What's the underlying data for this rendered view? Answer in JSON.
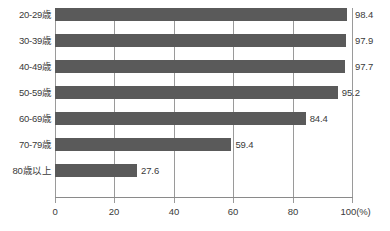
{
  "chart_data": {
    "type": "bar",
    "orientation": "horizontal",
    "title": "",
    "subtitle": "",
    "xlabel": "(%)",
    "ylabel": "",
    "categories": [
      "20-29歳",
      "30-39歳",
      "40-49歳",
      "50-59歳",
      "60-69歳",
      "70-79歳",
      "80歳以上"
    ],
    "values": [
      98.4,
      97.9,
      97.7,
      95.2,
      84.4,
      59.4,
      27.6
    ],
    "value_labels": [
      "98.4",
      "97.9",
      "97.7",
      "95.2",
      "84.4",
      "59.4",
      "27.6"
    ],
    "xlim": [
      0,
      100
    ],
    "xticks": [
      0,
      20,
      40,
      60,
      80,
      100
    ],
    "xtick_labels": [
      "0",
      "20",
      "40",
      "60",
      "80",
      "100"
    ],
    "x_unit_label": "(%)",
    "grid": true,
    "grid_axis": "x",
    "legend": false,
    "legend_position": "none",
    "series": [
      {
        "name": "",
        "values": [
          98.4,
          97.9,
          97.7,
          95.2,
          84.4,
          59.4,
          27.6
        ]
      }
    ]
  },
  "colors": {
    "bar": "#5a5a5a",
    "gridline": "#9a9a9a",
    "axis": "#8a8a8a",
    "text": "#3a3a3a",
    "background": "#ffffff"
  }
}
